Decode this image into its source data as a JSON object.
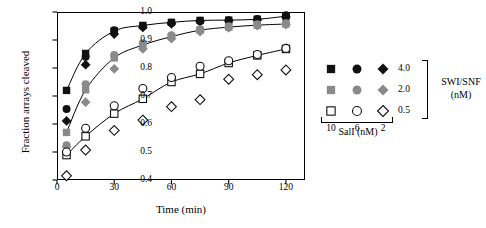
{
  "chart_data": {
    "type": "scatter",
    "title": "",
    "xlabel": "Time (min)",
    "ylabel": "Fraction arrays cleaved",
    "xlim": [
      0,
      130
    ],
    "ylim": [
      0.4,
      1.0
    ],
    "xticks": [
      0,
      30,
      60,
      90,
      120
    ],
    "yticks": [
      0.4,
      0.5,
      0.6,
      0.7,
      0.8,
      0.9,
      1.0
    ],
    "ytick_labels": [
      "0.4",
      "0.5",
      "0.6",
      "0.7",
      "0.8",
      "0.9",
      "1.0"
    ],
    "xtick_labels": [
      "0",
      "30",
      "60",
      "90",
      "120"
    ],
    "grid": false,
    "legend_position": "right",
    "x": [
      5,
      15,
      30,
      45,
      60,
      75,
      90,
      105,
      120
    ],
    "series": [
      {
        "name": "SalI 10 nM / SWI-SNF 4.0 nM",
        "marker": "square",
        "fill": "black",
        "fitted_curve": true,
        "values": [
          0.72,
          0.852,
          0.932,
          0.952,
          0.963,
          0.97,
          0.971,
          0.974,
          0.985
        ]
      },
      {
        "name": "SalI 6 nM / SWI-SNF 4.0 nM",
        "marker": "circle",
        "fill": "black",
        "fitted_curve": false,
        "values": [
          0.654,
          0.84,
          0.935,
          0.95,
          0.962,
          0.968,
          0.97,
          0.975,
          0.988
        ]
      },
      {
        "name": "SalI 2 nM / SWI-SNF 4.0 nM",
        "marker": "diamond",
        "fill": "black",
        "fitted_curve": false,
        "values": [
          0.611,
          0.812,
          0.921,
          0.945,
          0.958,
          0.966,
          0.969,
          0.972,
          0.982
        ]
      },
      {
        "name": "SalI 10 nM / SWI-SNF 2.0 nM",
        "marker": "square",
        "fill": "gray",
        "fitted_curve": true,
        "values": [
          0.57,
          0.722,
          0.836,
          0.882,
          0.912,
          0.935,
          0.946,
          0.953,
          0.957
        ]
      },
      {
        "name": "SalI 6 nM / SWI-SNF 2.0 nM",
        "marker": "circle",
        "fill": "gray",
        "fitted_curve": false,
        "values": [
          0.524,
          0.742,
          0.846,
          0.888,
          0.917,
          0.938,
          0.949,
          0.956,
          0.96
        ]
      },
      {
        "name": "SalI 2 nM / SWI-SNF 2.0 nM",
        "marker": "diamond",
        "fill": "gray",
        "fitted_curve": false,
        "values": [
          0.518,
          0.678,
          0.797,
          0.868,
          0.905,
          0.93,
          0.943,
          0.951,
          0.955
        ]
      },
      {
        "name": "SalI 10 nM / SWI-SNF 0.5 nM",
        "marker": "square",
        "fill": "open",
        "fitted_curve": true,
        "values": [
          0.489,
          0.556,
          0.637,
          0.69,
          0.75,
          0.779,
          0.818,
          0.845,
          0.868
        ]
      },
      {
        "name": "SalI 6 nM / SWI-SNF 0.5 nM",
        "marker": "circle",
        "fill": "open",
        "fitted_curve": false,
        "values": [
          0.5,
          0.585,
          0.665,
          0.727,
          0.766,
          0.806,
          0.826,
          0.848,
          0.87
        ]
      },
      {
        "name": "SalI 2 nM / SWI-SNF 0.5 nM",
        "marker": "diamond",
        "fill": "open",
        "fitted_curve": false,
        "values": [
          0.415,
          0.507,
          0.577,
          0.614,
          0.662,
          0.687,
          0.76,
          0.776,
          0.793
        ]
      }
    ]
  },
  "legend": {
    "row_group_label": "SWI/SNF\n(nM)",
    "row_group_label_line1": "SWI/SNF",
    "row_group_label_line2": "(nM)",
    "col_group_label": "SalI (nM)",
    "row_values": [
      "4.0",
      "2.0",
      "0.5"
    ],
    "col_values": [
      "10",
      "6",
      "2"
    ],
    "row_fills": [
      "black",
      "gray",
      "open"
    ],
    "col_markers": [
      "square",
      "circle",
      "diamond"
    ]
  },
  "colors": {
    "black": "#111111",
    "gray": "#8a8a8a",
    "open_stroke": "#111111",
    "open_fill": "#ffffff",
    "axis": "#000000",
    "background": "#ffffff"
  }
}
